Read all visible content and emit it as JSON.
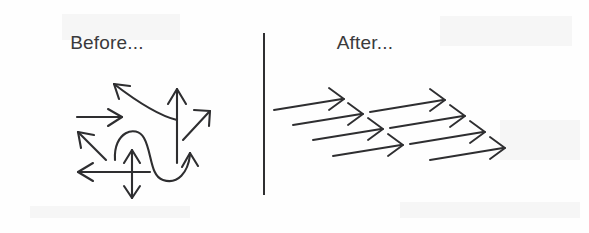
{
  "figure": {
    "kind": "before-after-alignment-diagram",
    "background_color": "#fefefe",
    "ink_color": "#2e2e30",
    "text_color": "#3a3a3c",
    "width": 589,
    "height": 233
  },
  "panels": {
    "before": {
      "title": "Before...",
      "description": "Arrows pointing in many conflicting directions",
      "arrow_count": 9,
      "arrows": [
        {
          "name": "curved-up-left-arrow",
          "direction": "up-left",
          "shape": "curved"
        },
        {
          "name": "horizontal-right-arrow",
          "direction": "right",
          "shape": "straight"
        },
        {
          "name": "diagonal-up-left-arrow",
          "direction": "up-left",
          "shape": "straight"
        },
        {
          "name": "long-left-arrow",
          "direction": "left",
          "shape": "straight"
        },
        {
          "name": "vertical-double-headed-arrow",
          "direction": "up-and-down",
          "shape": "straight"
        },
        {
          "name": "s-curve-arrow",
          "direction": "up",
          "shape": "s-curve"
        },
        {
          "name": "tall-vertical-up-arrow",
          "direction": "up",
          "shape": "straight"
        },
        {
          "name": "diagonal-up-right-arrow",
          "direction": "up-right",
          "shape": "straight"
        },
        {
          "name": "curved-up-right-arrow",
          "direction": "up-right",
          "shape": "curved"
        }
      ]
    },
    "after": {
      "title": "After...",
      "description": "Arrows all aligned pointing the same direction",
      "arrow_count": 8,
      "columns": 2,
      "rows": 4,
      "arrow_direction": "right",
      "arrows": [
        {
          "name": "aligned-arrow-r1c1",
          "row": 1,
          "column": 1,
          "direction": "right"
        },
        {
          "name": "aligned-arrow-r2c1",
          "row": 2,
          "column": 1,
          "direction": "right"
        },
        {
          "name": "aligned-arrow-r3c1",
          "row": 3,
          "column": 1,
          "direction": "right"
        },
        {
          "name": "aligned-arrow-r4c1",
          "row": 4,
          "column": 1,
          "direction": "right"
        },
        {
          "name": "aligned-arrow-r1c2",
          "row": 1,
          "column": 2,
          "direction": "right"
        },
        {
          "name": "aligned-arrow-r2c2",
          "row": 2,
          "column": 2,
          "direction": "right"
        },
        {
          "name": "aligned-arrow-r3c2",
          "row": 3,
          "column": 2,
          "direction": "right"
        },
        {
          "name": "aligned-arrow-r4c2",
          "row": 4,
          "column": 2,
          "direction": "right"
        }
      ]
    }
  },
  "divider": {
    "name": "vertical-divider",
    "orientation": "vertical",
    "color": "#2f2f31"
  }
}
